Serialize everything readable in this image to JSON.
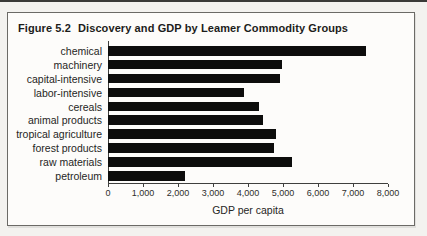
{
  "figure": {
    "label": "Figure 5.2",
    "title": "Discovery and GDP by Leamer Commodity Groups"
  },
  "chart_data": {
    "type": "bar",
    "orientation": "horizontal",
    "categories": [
      "chemical",
      "machinery",
      "capital-intensive",
      "labor-intensive",
      "cereals",
      "animal products",
      "tropical agriculture",
      "forest products",
      "raw materials",
      "petroleum"
    ],
    "values": [
      6750,
      4550,
      4500,
      3550,
      3950,
      4050,
      4400,
      4350,
      4800,
      2000
    ],
    "xlabel": "GDP per capita",
    "ylabel": "",
    "xlim": [
      0,
      8000
    ],
    "xticks": [
      0,
      1000,
      2000,
      3000,
      4000,
      5000,
      6000,
      7000,
      8000
    ],
    "xtick_labels": [
      "0",
      "1,000",
      "2,000",
      "3,000",
      "4,000",
      "5,000",
      "6,000",
      "7,000",
      "8,000"
    ],
    "bar_color": "#0d0d0c",
    "grid": "off",
    "legend": "none"
  }
}
